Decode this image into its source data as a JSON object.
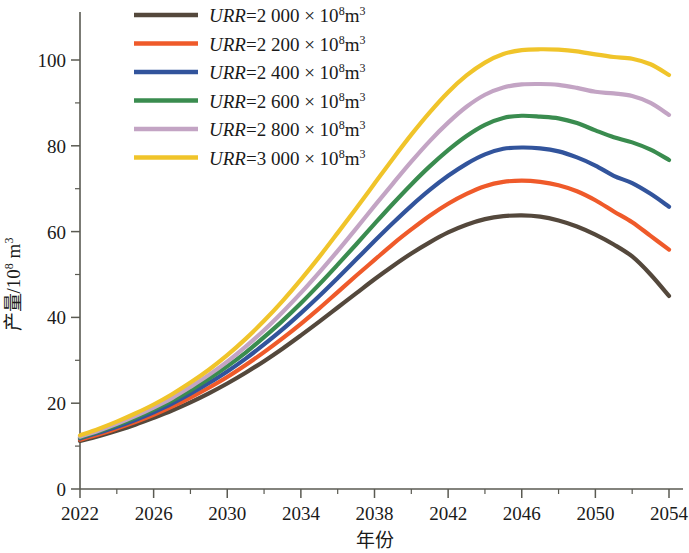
{
  "chart_data": {
    "type": "line",
    "title": "",
    "xlabel": "年份",
    "ylabel": "产量/10⁸ m³",
    "ylabel_parts": {
      "base": "产量/10",
      "exponent": "8",
      "unit": "m",
      "unit_exponent": "3"
    },
    "xlim": [
      2022,
      2054
    ],
    "ylim": [
      0,
      108
    ],
    "x_ticks": [
      2022,
      2026,
      2030,
      2034,
      2038,
      2042,
      2046,
      2050,
      2054
    ],
    "x_tick_labels": [
      "2022",
      "2026",
      "2030",
      "2034",
      "2038",
      "2042",
      "2046",
      "2050",
      "2054"
    ],
    "x_minor_ticks": [
      2024,
      2028,
      2032,
      2036,
      2040,
      2044,
      2048,
      2052
    ],
    "y_ticks": [
      0,
      20,
      40,
      60,
      80,
      100
    ],
    "y_tick_labels": [
      "0",
      "20",
      "40",
      "60",
      "80",
      "100"
    ],
    "y_minor_ticks": [
      10,
      30,
      50,
      70,
      90
    ],
    "grid": false,
    "legend_position": "top-left-inside",
    "x": [
      2022,
      2023,
      2024,
      2025,
      2026,
      2027,
      2028,
      2029,
      2030,
      2031,
      2032,
      2033,
      2034,
      2035,
      2036,
      2037,
      2038,
      2039,
      2040,
      2041,
      2042,
      2043,
      2044,
      2045,
      2046,
      2047,
      2048,
      2049,
      2050,
      2051,
      2052,
      2053,
      2054
    ],
    "series": [
      {
        "name": "URR=2 000 × 10⁸m³",
        "urr_value": "2 000",
        "color": "#54483c",
        "peak_year": 2047,
        "peak_value": 63.8,
        "values": [
          11.2,
          12.3,
          13.6,
          15.0,
          16.6,
          18.3,
          20.2,
          22.3,
          24.6,
          27.1,
          29.8,
          32.7,
          35.8,
          39.0,
          42.3,
          45.6,
          48.9,
          52.0,
          54.9,
          57.5,
          59.8,
          61.6,
          62.9,
          63.6,
          63.8,
          63.5,
          62.6,
          61.2,
          59.3,
          57.0,
          54.2,
          50.0,
          45.0
        ]
      },
      {
        "name": "URR=2 200 × 10⁸m³",
        "urr_value": "2 200",
        "color": "#ef5a2a",
        "peak_year": 2048,
        "peak_value": 71.9,
        "values": [
          11.5,
          12.7,
          14.1,
          15.6,
          17.3,
          19.2,
          21.3,
          23.6,
          26.1,
          28.9,
          31.9,
          35.1,
          38.5,
          42.1,
          45.9,
          49.7,
          53.4,
          57.1,
          60.5,
          63.7,
          66.5,
          68.8,
          70.6,
          71.6,
          71.9,
          71.6,
          70.8,
          69.4,
          67.3,
          64.7,
          62.2,
          59.0,
          55.8
        ]
      },
      {
        "name": "URR=2 400 × 10⁸m³",
        "urr_value": "2 400",
        "color": "#32549c",
        "peak_year": 2049,
        "peak_value": 79.6,
        "values": [
          11.8,
          13.1,
          14.5,
          16.1,
          17.9,
          19.9,
          22.2,
          24.7,
          27.4,
          30.4,
          33.7,
          37.2,
          41.0,
          45.0,
          49.2,
          53.5,
          57.8,
          62.0,
          66.0,
          69.7,
          73.0,
          75.8,
          78.0,
          79.3,
          79.6,
          79.4,
          78.7,
          77.3,
          75.4,
          73.0,
          71.3,
          68.8,
          65.8
        ]
      },
      {
        "name": "URR=2 600 × 10⁸m³",
        "urr_value": "2 600",
        "color": "#3a8c4f",
        "peak_year": 2050,
        "peak_value": 87.0,
        "values": [
          12.0,
          13.4,
          14.9,
          16.6,
          18.5,
          20.6,
          23.0,
          25.7,
          28.6,
          31.8,
          35.4,
          39.2,
          43.3,
          47.7,
          52.3,
          57.0,
          61.8,
          66.5,
          71.0,
          75.2,
          79.0,
          82.3,
          84.9,
          86.5,
          87.0,
          86.8,
          86.4,
          85.3,
          83.6,
          82.0,
          80.8,
          79.1,
          76.7
        ]
      },
      {
        "name": "URR=2 800 × 10⁸m³",
        "urr_value": "2 800",
        "color": "#c3a4c4",
        "peak_year": 2051,
        "peak_value": 94.4,
        "values": [
          12.2,
          13.6,
          15.2,
          17.0,
          19.0,
          21.2,
          23.8,
          26.6,
          29.7,
          33.2,
          37.0,
          41.2,
          45.7,
          50.5,
          55.5,
          60.7,
          66.0,
          71.2,
          76.3,
          81.1,
          85.4,
          89.1,
          91.9,
          93.6,
          94.3,
          94.4,
          94.2,
          93.5,
          92.6,
          92.2,
          91.6,
          90.0,
          87.2
        ]
      },
      {
        "name": "URR=3 000 × 10⁸m³",
        "urr_value": "3 000",
        "color": "#f0c42a",
        "peak_year": 2051,
        "peak_value": 102.5,
        "values": [
          12.5,
          14.0,
          15.7,
          17.6,
          19.7,
          22.1,
          24.8,
          27.8,
          31.2,
          35.0,
          39.2,
          43.8,
          48.8,
          54.1,
          59.7,
          65.4,
          71.2,
          77.0,
          82.6,
          87.8,
          92.5,
          96.4,
          99.4,
          101.4,
          102.3,
          102.5,
          102.4,
          102.0,
          101.3,
          100.7,
          100.3,
          99.0,
          96.5
        ]
      }
    ]
  },
  "legend": {
    "items": [
      {
        "label_prefix": "URR",
        "label_eq": "=2 000 × 10",
        "exp": "8",
        "unit": "m",
        "unit_exp": "3",
        "color": "#54483c"
      },
      {
        "label_prefix": "URR",
        "label_eq": "=2 200 × 10",
        "exp": "8",
        "unit": "m",
        "unit_exp": "3",
        "color": "#ef5a2a"
      },
      {
        "label_prefix": "URR",
        "label_eq": "=2 400 × 10",
        "exp": "8",
        "unit": "m",
        "unit_exp": "3",
        "color": "#32549c"
      },
      {
        "label_prefix": "URR",
        "label_eq": "=2 600 × 10",
        "exp": "8",
        "unit": "m",
        "unit_exp": "3",
        "color": "#3a8c4f"
      },
      {
        "label_prefix": "URR",
        "label_eq": "=2 800 × 10",
        "exp": "8",
        "unit": "m",
        "unit_exp": "3",
        "color": "#c3a4c4"
      },
      {
        "label_prefix": "URR",
        "label_eq": "=3 000 × 10",
        "exp": "8",
        "unit": "m",
        "unit_exp": "3",
        "color": "#f0c42a"
      }
    ]
  },
  "axes": {
    "x_title": "年份",
    "y_title_base": "产量/10",
    "y_title_exp": "8",
    "y_title_unit": "m",
    "y_title_unit_exp": "3"
  },
  "colors": {
    "axis": "#5a5a52",
    "text": "#1a1a1a",
    "background": "#ffffff"
  }
}
